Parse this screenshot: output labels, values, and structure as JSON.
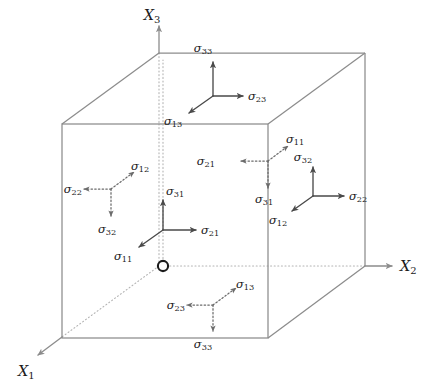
{
  "figure": {
    "background_color": "#ffffff",
    "edge_color": "#8c8c8c",
    "hidden_edge_color": "#b3b3b3",
    "arrow_color": "#4a4a4a",
    "dotted_arrow_color": "#6b6b6b",
    "text_color": "#1b1b1b",
    "origin_marker_color": "#1b1b1b"
  },
  "axes": [
    {
      "id": "x1",
      "symbol": "X",
      "subscript": "1",
      "label": "X₁",
      "direction": "down-left"
    },
    {
      "id": "x2",
      "symbol": "X",
      "subscript": "2",
      "label": "X₂",
      "direction": "right"
    },
    {
      "id": "x3",
      "symbol": "X",
      "subscript": "3",
      "label": "X₃",
      "direction": "up"
    }
  ],
  "origin": {
    "name": "origin-marker",
    "label": "O"
  },
  "triads": [
    {
      "id": "top-face",
      "face": "top",
      "line_style": "solid",
      "components": [
        {
          "symbol": "σ",
          "subscript": "33",
          "label": "σ₃₃",
          "direction": "up"
        },
        {
          "symbol": "σ",
          "subscript": "23",
          "label": "σ₂₃",
          "direction": "right"
        },
        {
          "symbol": "σ",
          "subscript": "13",
          "label": "σ₁₃",
          "direction": "down-left"
        }
      ]
    },
    {
      "id": "front-face",
      "face": "front",
      "line_style": "solid",
      "components": [
        {
          "symbol": "σ",
          "subscript": "31",
          "label": "σ₃₁",
          "direction": "up"
        },
        {
          "symbol": "σ",
          "subscript": "21",
          "label": "σ₂₁",
          "direction": "right"
        },
        {
          "symbol": "σ",
          "subscript": "11",
          "label": "σ₁₁",
          "direction": "down-left"
        }
      ]
    },
    {
      "id": "right-face",
      "face": "right",
      "line_style": "solid",
      "components": [
        {
          "symbol": "σ",
          "subscript": "32",
          "label": "σ₃₂",
          "direction": "up"
        },
        {
          "symbol": "σ",
          "subscript": "22",
          "label": "σ₂₂",
          "direction": "right"
        },
        {
          "symbol": "σ",
          "subscript": "12",
          "label": "σ₁₂",
          "direction": "down-left"
        }
      ]
    },
    {
      "id": "back-face",
      "face": "back",
      "line_style": "dotted",
      "components": [
        {
          "symbol": "σ",
          "subscript": "11",
          "label": "σ₁₁",
          "direction": "up-right"
        },
        {
          "symbol": "σ",
          "subscript": "21",
          "label": "σ₂₁",
          "direction": "left"
        },
        {
          "symbol": "σ",
          "subscript": "31",
          "label": "σ₃₁",
          "direction": "down"
        }
      ]
    },
    {
      "id": "left-face",
      "face": "left",
      "line_style": "dotted",
      "components": [
        {
          "symbol": "σ",
          "subscript": "12",
          "label": "σ₁₂",
          "direction": "up-right"
        },
        {
          "symbol": "σ",
          "subscript": "22",
          "label": "σ₂₂",
          "direction": "left"
        },
        {
          "symbol": "σ",
          "subscript": "32",
          "label": "σ₃₂",
          "direction": "down"
        }
      ]
    },
    {
      "id": "bottom-face",
      "face": "bottom",
      "line_style": "dotted",
      "components": [
        {
          "symbol": "σ",
          "subscript": "13",
          "label": "σ₁₃",
          "direction": "up-right"
        },
        {
          "symbol": "σ",
          "subscript": "23",
          "label": "σ₂₃",
          "direction": "left"
        },
        {
          "symbol": "σ",
          "subscript": "33",
          "label": "σ₃₃",
          "direction": "down"
        }
      ]
    }
  ]
}
